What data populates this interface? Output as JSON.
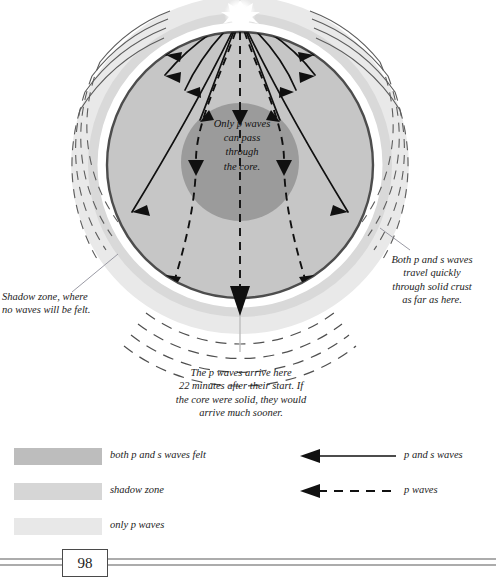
{
  "page": {
    "number": "98"
  },
  "diagram": {
    "annotations": {
      "core": "Only p waves\ncan pass\nthrough\nthe core.",
      "right": "Both p and s waves\ntravel quickly\nthrough solid crust\nas far as here.",
      "left": "Shadow zone, where\nno waves will be felt.",
      "bottom": "The p waves arrive here\n22 minutes after their start. If\nthe core were solid, they would\narrive much sooner."
    },
    "colors": {
      "mantle": "#c7c7c7",
      "core": "#9a9a9a",
      "crust_band": "#d8d8d8",
      "outer_band": "#e7e7e7",
      "outline": "#4a4a4a",
      "wave_line": "#111111",
      "leader_line": "#8d8d99",
      "epicenter": "#ffffff"
    },
    "epicenter": {
      "label": "earthquake-focus",
      "x": 240,
      "y": 14
    }
  },
  "legend": {
    "swatches": [
      {
        "label": "both p and s waves felt",
        "color": "#bdbdbd"
      },
      {
        "label": "shadow zone",
        "color": "#d6d6d6"
      },
      {
        "label": "only p waves",
        "color": "#e8e8e8"
      }
    ],
    "lines": [
      {
        "label": "p and s waves",
        "style": "solid"
      },
      {
        "label": "p waves",
        "style": "dashed"
      }
    ]
  }
}
